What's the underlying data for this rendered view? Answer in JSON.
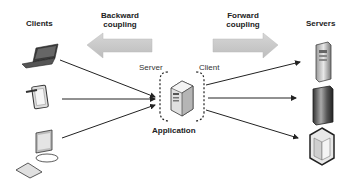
{
  "diagram": {
    "clients_label": "Clients",
    "servers_label": "Servers",
    "backward_coupling_label": [
      "Backward",
      "coupling"
    ],
    "forward_coupling_label": [
      "Forward",
      "coupling"
    ],
    "server_side_label": "Server",
    "client_side_label": "Client",
    "application_label": "Application",
    "clients": [
      {
        "icon": "laptop-icon"
      },
      {
        "icon": "tablet-icon"
      },
      {
        "icon": "desktop-icon"
      }
    ],
    "servers": [
      {
        "icon": "tower-server-icon"
      },
      {
        "icon": "rack-server-icon"
      },
      {
        "icon": "cabinet-server-icon"
      }
    ],
    "colors": {
      "arrow": "#222222",
      "coupling_arrow": "#c8c8c8",
      "text": "#222222"
    }
  }
}
